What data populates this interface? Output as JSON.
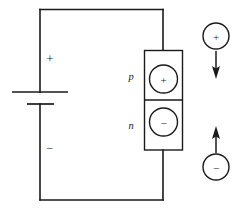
{
  "figure": {
    "type": "circuit-schematic",
    "background_color": "#ffffff",
    "line_color": "#1a1a1a"
  },
  "circuit": {
    "battery": {
      "name": "battery",
      "positive_terminal_label": "+",
      "negative_terminal_label": "−"
    },
    "wire": {
      "top_label": "",
      "bottom_label": ""
    }
  },
  "junction": {
    "p_region": {
      "label": "p",
      "carrier_sign": "+"
    },
    "n_region": {
      "label": "n",
      "carrier_sign": "−"
    }
  },
  "free_charges": {
    "positive": {
      "sign": "+",
      "direction": "down"
    },
    "negative": {
      "sign": "−",
      "direction": "up"
    }
  }
}
